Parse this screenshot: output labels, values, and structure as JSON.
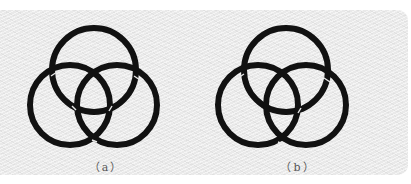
{
  "figure": {
    "background_color": "#e9e9e9",
    "ring_color": "#111111",
    "panels": [
      {
        "id": "a",
        "caption": "（a）",
        "rings": [
          {
            "name": "top",
            "cx": 88,
            "cy": 60,
            "r": 42
          },
          {
            "name": "left",
            "cx": 64,
            "cy": 95,
            "r": 40
          },
          {
            "name": "right",
            "cx": 111,
            "cy": 95,
            "r": 40
          }
        ]
      },
      {
        "id": "b",
        "caption": "（b）",
        "rings": [
          {
            "name": "top",
            "cx": 88,
            "cy": 60,
            "r": 42
          },
          {
            "name": "left",
            "cx": 60,
            "cy": 95,
            "r": 40
          },
          {
            "name": "right",
            "cx": 108,
            "cy": 95,
            "r": 40
          }
        ]
      }
    ]
  }
}
